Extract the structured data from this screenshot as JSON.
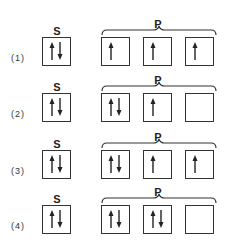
{
  "header_text": "",
  "labels": {
    "s": "S",
    "p": "P"
  },
  "options": [
    {
      "number": "(1)",
      "s": [
        "up",
        "down"
      ],
      "p": [
        [
          "up"
        ],
        [
          "up"
        ],
        [
          "up"
        ]
      ]
    },
    {
      "number": "(2)",
      "s": [
        "up",
        "down"
      ],
      "p": [
        [
          "up",
          "down"
        ],
        [
          "up"
        ],
        []
      ]
    },
    {
      "number": "(3)",
      "s": [
        "up",
        "down"
      ],
      "p": [
        [
          "up",
          "down"
        ],
        [
          "up"
        ],
        [
          "up"
        ]
      ]
    },
    {
      "number": "(4)",
      "s": [
        "up",
        "down"
      ],
      "p": [
        [
          "up",
          "down"
        ],
        [
          "up",
          "down"
        ],
        []
      ]
    }
  ]
}
